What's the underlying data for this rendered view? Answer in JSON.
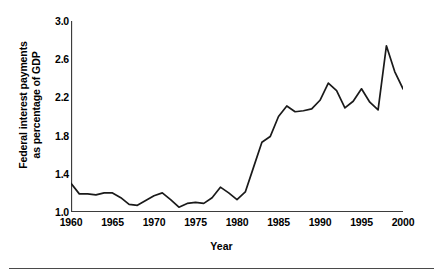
{
  "chart_data": {
    "type": "line",
    "title": "",
    "subtitle": "",
    "xlabel": "Year",
    "ylabel": "Federal interest payments\nas percentage of GDP",
    "ylabel_lines": [
      "Federal interest payments",
      "as percentage of GDP"
    ],
    "xlim": [
      1960,
      2000
    ],
    "ylim": [
      1.0,
      3.0
    ],
    "xticks": [
      1960,
      1965,
      1970,
      1975,
      1980,
      1985,
      1990,
      1995,
      2000
    ],
    "xtick_labels": [
      "1960",
      "1965",
      "1970",
      "1975",
      "1980",
      "1985",
      "1990",
      "1995",
      "2000"
    ],
    "yticks": [
      1.0,
      1.4,
      1.8,
      2.2,
      2.6,
      3.0
    ],
    "ytick_labels": [
      "1.0",
      "1.4",
      "1.8",
      "2.2",
      "2.6",
      "3.0"
    ],
    "grid": false,
    "legend": null,
    "line_color": "#1a1a1a",
    "line_width": 1.6,
    "x": [
      1960,
      1961,
      1962,
      1963,
      1964,
      1965,
      1966,
      1967,
      1968,
      1969,
      1970,
      1971,
      1972,
      1973,
      1974,
      1975,
      1976,
      1977,
      1978,
      1979,
      1980,
      1981,
      1982,
      1983,
      1984,
      1985,
      1986,
      1987,
      1988,
      1989,
      1990,
      1991,
      1992,
      1993,
      1994,
      1995,
      1996,
      1997,
      1998,
      1999,
      2000
    ],
    "values": [
      1.3,
      1.19,
      1.19,
      1.18,
      1.2,
      1.2,
      1.15,
      1.08,
      1.07,
      1.12,
      1.17,
      1.2,
      1.13,
      1.05,
      1.09,
      1.1,
      1.09,
      1.15,
      1.26,
      1.2,
      1.13,
      1.21,
      1.47,
      1.73,
      1.79,
      2.0,
      2.11,
      2.05,
      2.06,
      2.08,
      2.17,
      2.35,
      2.27,
      2.09,
      2.16,
      2.29,
      2.15,
      2.07,
      2.74,
      2.47,
      2.29
    ],
    "series_name": "Federal interest payments as percentage of GDP",
    "units": "percent of GDP"
  },
  "axis_style": {
    "axis_color": "#3d3d3d",
    "text_color": "#000000"
  }
}
